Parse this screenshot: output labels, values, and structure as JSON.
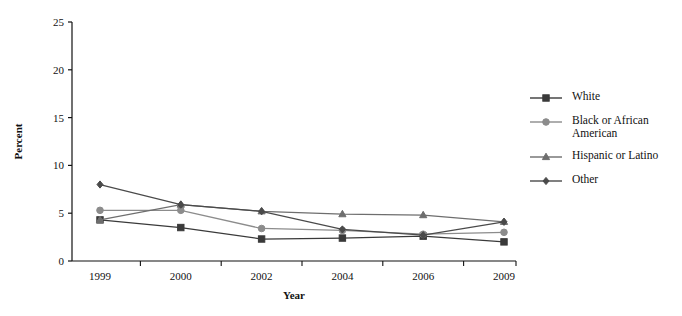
{
  "chart_data": {
    "type": "line",
    "title": "",
    "subtitle": "",
    "xlabel": "Year",
    "ylabel": "Percent",
    "categories": [
      "1999",
      "2000",
      "2002",
      "2004",
      "2006",
      "2009"
    ],
    "x": [
      1999,
      2000,
      2002,
      2004,
      2006,
      2009
    ],
    "ylim": [
      0,
      25
    ],
    "yticks": [
      0,
      5,
      10,
      15,
      20,
      25
    ],
    "ytick_labels": [
      "0",
      "5",
      "10",
      "15",
      "20",
      "25"
    ],
    "grid": false,
    "legend_position": "right",
    "series": [
      {
        "name": "White",
        "marker": "square",
        "color": "#3a3a3a",
        "values": [
          4.3,
          3.5,
          2.3,
          2.4,
          2.6,
          2.0
        ]
      },
      {
        "name": "Black or African American",
        "marker": "circle",
        "color": "#8c8c8c",
        "values": [
          5.3,
          5.3,
          3.4,
          3.2,
          2.8,
          3.0
        ]
      },
      {
        "name": "Hispanic or Latino",
        "marker": "triangle",
        "color": "#6e6e6e",
        "values": [
          4.3,
          5.9,
          5.2,
          4.9,
          4.8,
          4.1
        ]
      },
      {
        "name": "Other",
        "marker": "diamond",
        "color": "#4a4a4a",
        "values": [
          8.0,
          5.9,
          5.2,
          3.3,
          2.7,
          4.1
        ]
      }
    ]
  },
  "legend": {
    "items": [
      {
        "label": "White"
      },
      {
        "label": "Black or African American"
      },
      {
        "label": "Hispanic or Latino"
      },
      {
        "label": "Other"
      }
    ]
  },
  "axes": {
    "y_title": "Percent",
    "x_title": "Year"
  }
}
